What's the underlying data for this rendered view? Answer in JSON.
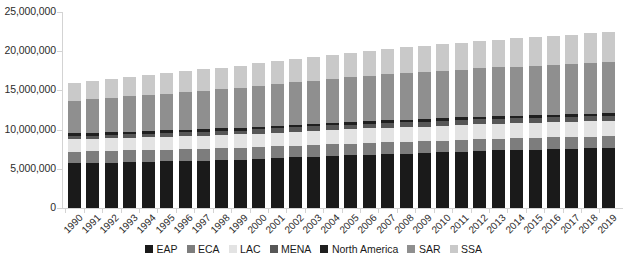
{
  "chart_data": {
    "type": "bar",
    "stacked": true,
    "title": "",
    "xlabel": "",
    "ylabel": "",
    "ylim": [
      0,
      25000000
    ],
    "ytick_labels": [
      "0",
      "5,000,000",
      "10,000,000",
      "15,000,000",
      "20,000,000",
      "25,000,000"
    ],
    "ytick_values": [
      0,
      5000000,
      10000000,
      15000000,
      20000000,
      25000000
    ],
    "grid": false,
    "legend_position": "bottom",
    "categories": [
      "1990",
      "1991",
      "1992",
      "1993",
      "1994",
      "1995",
      "1996",
      "1997",
      "1998",
      "1999",
      "2000",
      "2001",
      "2002",
      "2003",
      "2004",
      "2005",
      "2006",
      "2007",
      "2008",
      "2009",
      "2010",
      "2011",
      "2012",
      "2013",
      "2014",
      "2015",
      "2016",
      "2017",
      "2018",
      "2019"
    ],
    "series": [
      {
        "name": "EAP",
        "color": "#1a1a1a",
        "values": [
          5700000,
          5750000,
          5800000,
          5850000,
          5900000,
          5950000,
          6000000,
          6050000,
          6100000,
          6150000,
          6250000,
          6350000,
          6450000,
          6550000,
          6650000,
          6700000,
          6800000,
          6900000,
          6950000,
          7000000,
          7100000,
          7200000,
          7300000,
          7350000,
          7400000,
          7450000,
          7500000,
          7550000,
          7600000,
          7650000
        ]
      },
      {
        "name": "ECA",
        "color": "#7d7d7d",
        "values": [
          1500000,
          1500000,
          1500000,
          1500000,
          1500000,
          1500000,
          1500000,
          1500000,
          1500000,
          1500000,
          1500000,
          1500000,
          1500000,
          1500000,
          1500000,
          1500000,
          1500000,
          1500000,
          1500000,
          1500000,
          1500000,
          1500000,
          1500000,
          1500000,
          1500000,
          1500000,
          1500000,
          1500000,
          1500000,
          1500000
        ]
      },
      {
        "name": "LAC",
        "color": "#e3e3e3",
        "values": [
          1550000,
          1570000,
          1590000,
          1610000,
          1630000,
          1650000,
          1670000,
          1690000,
          1710000,
          1730000,
          1750000,
          1770000,
          1790000,
          1810000,
          1830000,
          1850000,
          1860000,
          1870000,
          1880000,
          1890000,
          1900000,
          1910000,
          1920000,
          1930000,
          1940000,
          1950000,
          1960000,
          1960000,
          1960000,
          1960000
        ]
      },
      {
        "name": "MENA",
        "color": "#575757",
        "values": [
          420000,
          430000,
          440000,
          450000,
          460000,
          470000,
          480000,
          490000,
          500000,
          510000,
          520000,
          530000,
          540000,
          550000,
          560000,
          570000,
          580000,
          585000,
          590000,
          595000,
          600000,
          605000,
          610000,
          615000,
          620000,
          625000,
          630000,
          635000,
          640000,
          645000
        ]
      },
      {
        "name": "North America",
        "color": "#1f1f1f",
        "values": [
          340000,
          340000,
          340000,
          340000,
          340000,
          340000,
          340000,
          340000,
          340000,
          340000,
          340000,
          340000,
          340000,
          340000,
          340000,
          340000,
          340000,
          340000,
          340000,
          340000,
          340000,
          340000,
          340000,
          340000,
          340000,
          340000,
          340000,
          340000,
          340000,
          340000
        ]
      },
      {
        "name": "SAR",
        "color": "#8f8f8f",
        "values": [
          4200000,
          4300000,
          4400000,
          4500000,
          4600000,
          4700000,
          4800000,
          4900000,
          5000000,
          5100000,
          5200000,
          5300000,
          5400000,
          5500000,
          5600000,
          5700000,
          5800000,
          5900000,
          5950000,
          6000000,
          6050000,
          6100000,
          6150000,
          6200000,
          6250000,
          6300000,
          6350000,
          6400000,
          6450000,
          6500000
        ]
      },
      {
        "name": "SSA",
        "color": "#c9c9c9",
        "values": [
          2300000,
          2360000,
          2420000,
          2480000,
          2540000,
          2600000,
          2660000,
          2720000,
          2780000,
          2840000,
          2900000,
          2950000,
          3000000,
          3050000,
          3100000,
          3150000,
          3200000,
          3250000,
          3300000,
          3350000,
          3400000,
          3450000,
          3500000,
          3550000,
          3600000,
          3650000,
          3700000,
          3750000,
          3800000,
          3850000
        ]
      }
    ]
  },
  "legend": {
    "items": [
      {
        "label": "EAP"
      },
      {
        "label": "ECA"
      },
      {
        "label": "LAC"
      },
      {
        "label": "MENA"
      },
      {
        "label": "North America"
      },
      {
        "label": "SAR"
      },
      {
        "label": "SSA"
      }
    ]
  }
}
